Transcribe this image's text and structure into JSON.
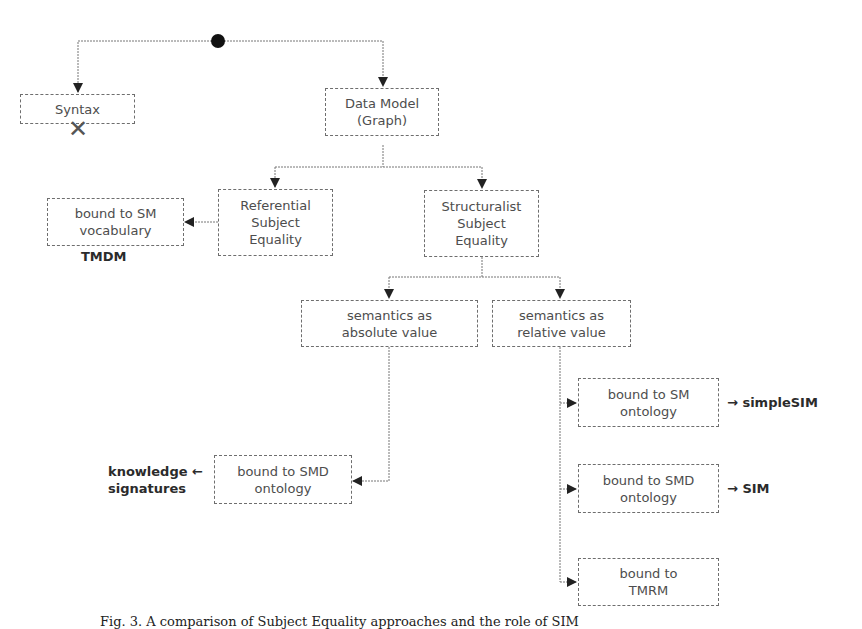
{
  "diagram": {
    "nodes": {
      "syntax": {
        "label": "Syntax",
        "rejected_mark": "✕"
      },
      "data_model": {
        "label_line1": "Data Model",
        "label_line2": "(Graph)"
      },
      "referential": {
        "line1": "Referential",
        "line2": "Subject",
        "line3": "Equality"
      },
      "structuralist": {
        "line1": "Structuralist",
        "line2": "Subject",
        "line3": "Equality"
      },
      "sm_vocabulary": {
        "line1": "bound to SM",
        "line2": "vocabulary"
      },
      "absolute": {
        "line1": "semantics as",
        "line2": "absolute value"
      },
      "relative": {
        "line1": "semantics as",
        "line2": "relative value"
      },
      "smd_ontology_left": {
        "line1": "bound to SMD",
        "line2": "ontology"
      },
      "sm_ontology": {
        "line1": "bound to SM",
        "line2": "ontology"
      },
      "smd_ontology_right": {
        "line1": "bound to SMD",
        "line2": "ontology"
      },
      "tmrm": {
        "line1": "bound to",
        "line2": "TMRM"
      }
    },
    "annotations": {
      "tmdm": "TMDM",
      "knowledge_line1": "knowledge ←",
      "knowledge_line2": "signatures",
      "simplesim": "→ simpleSIM",
      "sim": "→ SIM"
    },
    "caption": "Fig. 3. A comparison of Subject Equality approaches and the role of SIM"
  }
}
